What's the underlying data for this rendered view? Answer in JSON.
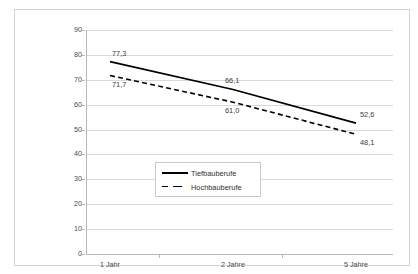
{
  "chart_data": {
    "type": "line",
    "title": "",
    "xlabel": "",
    "ylabel": "",
    "categories": [
      "1 Jahr",
      "2 Jahre",
      "5 Jahre"
    ],
    "yticks": [
      90,
      80,
      70,
      60,
      50,
      40,
      30,
      20,
      10,
      0
    ],
    "ylim": [
      0,
      90
    ],
    "grid": true,
    "legend_position": "center",
    "series": [
      {
        "name": "Tiefbauberufe",
        "style": "solid",
        "color": "#000000",
        "values": [
          77.3,
          66.1,
          52.6
        ],
        "labels": [
          "77,3",
          "66,1",
          "52,6"
        ]
      },
      {
        "name": "Hochbauberufe",
        "style": "dashed",
        "color": "#000000",
        "values": [
          71.7,
          61.0,
          48.1
        ],
        "labels": [
          "71,7",
          "61,0",
          "48,1"
        ]
      }
    ]
  },
  "legend": {
    "items": [
      {
        "label": "Tiefbauberufe"
      },
      {
        "label": "Hochbauberufe"
      }
    ]
  },
  "axis": {
    "y_tick_labels": [
      "90",
      "80",
      "70",
      "60",
      "50",
      "40",
      "30",
      "20",
      "10",
      "0"
    ],
    "x_tick_labels": [
      "1 Jahr",
      "2 Jahre",
      "5 Jahre"
    ]
  }
}
